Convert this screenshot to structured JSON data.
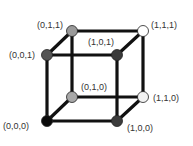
{
  "diagram": {
    "type": "cube",
    "vertices": [
      {
        "id": "v000",
        "label": "(0,0,0)",
        "x": 47,
        "y": 121,
        "color": "#0a0a0a",
        "label_x": 3,
        "label_y": 121
      },
      {
        "id": "v100",
        "label": "(1,0,0)",
        "x": 117,
        "y": 121,
        "color": "#3c3c3c",
        "label_x": 127,
        "label_y": 123
      },
      {
        "id": "v010",
        "label": "(0,1,0)",
        "x": 72,
        "y": 97,
        "color": "#a8a8a8",
        "label_x": 81,
        "label_y": 82
      },
      {
        "id": "v110",
        "label": "(1,1,0)",
        "x": 143,
        "y": 97,
        "color": "#f2f2f2",
        "label_x": 153,
        "label_y": 93
      },
      {
        "id": "v001",
        "label": "(0,0,1)",
        "x": 47,
        "y": 55,
        "color": "#555555",
        "label_x": 9,
        "label_y": 50
      },
      {
        "id": "v101",
        "label": "(1,0,1)",
        "x": 117,
        "y": 55,
        "color": "#3a3a3a",
        "label_x": 88,
        "label_y": 37
      },
      {
        "id": "v011",
        "label": "(0,1,1)",
        "x": 72,
        "y": 31,
        "color": "#9a9a9a",
        "label_x": 37,
        "label_y": 20
      },
      {
        "id": "v111",
        "label": "(1,1,1)",
        "x": 143,
        "y": 31,
        "color": "#ffffff",
        "label_x": 151,
        "label_y": 20
      }
    ],
    "edges": [
      [
        "v000",
        "v100"
      ],
      [
        "v000",
        "v010"
      ],
      [
        "v000",
        "v001"
      ],
      [
        "v100",
        "v110"
      ],
      [
        "v100",
        "v101"
      ],
      [
        "v010",
        "v110"
      ],
      [
        "v010",
        "v011"
      ],
      [
        "v001",
        "v101"
      ],
      [
        "v001",
        "v011"
      ],
      [
        "v110",
        "v111"
      ],
      [
        "v101",
        "v111"
      ],
      [
        "v011",
        "v111"
      ]
    ],
    "edge_color": "#111111"
  }
}
